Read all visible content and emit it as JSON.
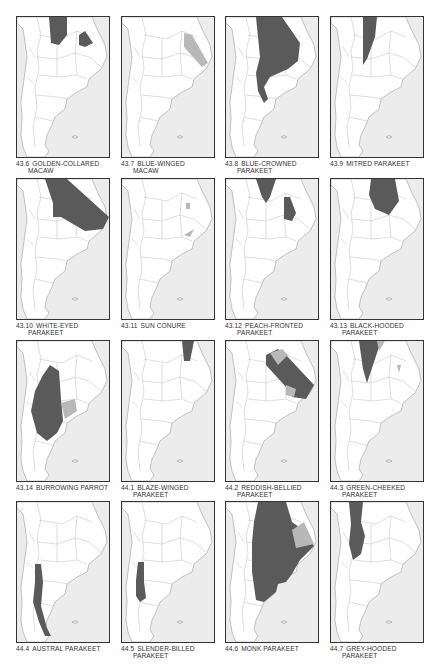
{
  "page": {
    "type": "distribution-maps-plate",
    "colors": {
      "sea": "#ececec",
      "land": "#ffffff",
      "border": "#8a8a8a",
      "range_primary": "#5a5a5a",
      "range_secondary": "#b8b8b8",
      "frame": "#333333"
    }
  },
  "maps": [
    {
      "id": "43.6",
      "line1": "GOLDEN-COLLARED",
      "line2": "MACAW",
      "range": "golden-collared"
    },
    {
      "id": "43.7",
      "line1": "BLUE-WINGED",
      "line2": "MACAW",
      "range": "blue-winged"
    },
    {
      "id": "43.8",
      "line1": "BLUE-CROWNED",
      "line2": "PARAKEET",
      "range": "blue-crowned"
    },
    {
      "id": "43.9",
      "line1": "MITRED PARAKEET",
      "line2": "",
      "range": "mitred"
    },
    {
      "id": "43.10",
      "line1": "WHITE-EYED",
      "line2": "PARAKEET",
      "range": "white-eyed"
    },
    {
      "id": "43.11",
      "line1": "SUN CONURE",
      "line2": "",
      "range": "sun-conure"
    },
    {
      "id": "43.12",
      "line1": "PEACH-FRONTED",
      "line2": "PARAKEET",
      "range": "peach-fronted"
    },
    {
      "id": "43.13",
      "line1": "BLACK-HOODED",
      "line2": "PARAKEET",
      "range": "black-hooded"
    },
    {
      "id": "43.14",
      "line1": "BURROWING PARROT",
      "line2": "",
      "range": "burrowing"
    },
    {
      "id": "44.1",
      "line1": "BLAZE-WINGED",
      "line2": "PARAKEET",
      "range": "blaze-winged"
    },
    {
      "id": "44.2",
      "line1": "REDDISH-BELLIED",
      "line2": "PARAKEET",
      "range": "reddish-bellied"
    },
    {
      "id": "44.3",
      "line1": "GREEN-CHEEKED",
      "line2": "PARAKEET",
      "range": "green-cheeked"
    },
    {
      "id": "44.4",
      "line1": "AUSTRAL PARAKEET",
      "line2": "",
      "range": "austral"
    },
    {
      "id": "44.5",
      "line1": "SLENDER-BILLED",
      "line2": "PARAKEET",
      "range": "slender-billed"
    },
    {
      "id": "44.6",
      "line1": "MONK PARAKEET",
      "line2": "",
      "range": "monk"
    },
    {
      "id": "44.7",
      "line1": "GREY-HOODED",
      "line2": "PARAKEET",
      "range": "grey-hooded"
    }
  ]
}
